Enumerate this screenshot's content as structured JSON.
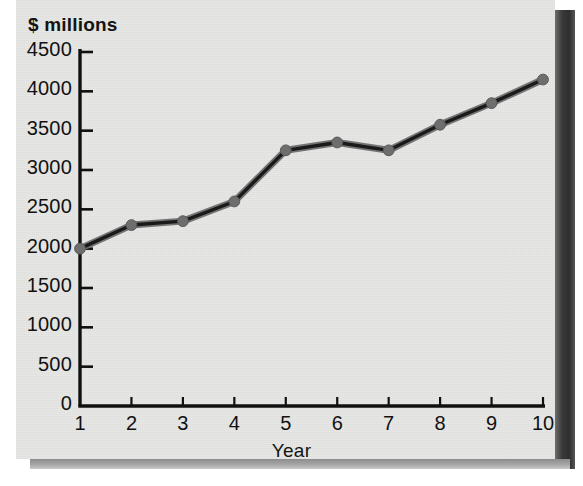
{
  "chart_data": {
    "type": "line",
    "title": "",
    "xlabel": "Year",
    "ylabel": "$ millions",
    "x": [
      1,
      2,
      3,
      4,
      5,
      6,
      7,
      8,
      9,
      10
    ],
    "values": [
      2000,
      2300,
      2350,
      2600,
      3250,
      3350,
      3250,
      3575,
      3850,
      4150
    ],
    "xtick_labels": [
      "1",
      "2",
      "3",
      "4",
      "5",
      "6",
      "7",
      "8",
      "9",
      "10"
    ],
    "ytick_labels": [
      "0",
      "500",
      "1000",
      "1500",
      "2000",
      "2500",
      "3000",
      "3500",
      "4000",
      "4500"
    ],
    "ytick_values": [
      0,
      500,
      1000,
      1500,
      2000,
      2500,
      3000,
      3500,
      4000,
      4500
    ],
    "ylim": [
      0,
      4500
    ],
    "xlim": [
      1,
      10
    ],
    "grid": false,
    "legend": null,
    "series": [
      {
        "name": "$ millions",
        "values": [
          2000,
          2300,
          2350,
          2600,
          3250,
          3350,
          3250,
          3575,
          3850,
          4150
        ]
      }
    ],
    "colors": {
      "line": "#1a1a1a",
      "marker": "#6e6e6e",
      "marker_edge": "#5a5a5a",
      "axis": "#101010",
      "plot_background": "#e7e7e5",
      "page_background": "#ffffff"
    }
  },
  "axes": {
    "y_axis_title": "$ millions",
    "x_axis_title": "Year"
  }
}
